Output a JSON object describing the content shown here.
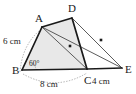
{
  "figure": {
    "kind": "geometry-diagram",
    "canvas": {
      "width": 136,
      "height": 94
    },
    "colors": {
      "background": "#ffffff",
      "shade_fill": "#e8e8e8",
      "stroke_heavy": "#1a1a1a",
      "stroke_light": "#555555",
      "dotted_arc": "#9a9a9a",
      "label_text": "#1a1a1a"
    },
    "vertices": [
      {
        "id": "A",
        "label": "A",
        "x": 42,
        "y": 27,
        "label_x": 35,
        "label_y": 22
      },
      {
        "id": "B",
        "label": "B",
        "x": 22,
        "y": 70,
        "label_x": 12,
        "label_y": 74
      },
      {
        "id": "C",
        "label": "C",
        "x": 87,
        "y": 69,
        "label_x": 84,
        "label_y": 84
      },
      {
        "id": "D",
        "label": "D",
        "x": 72,
        "y": 18,
        "label_x": 68,
        "label_y": 12
      },
      {
        "id": "E",
        "label": "E",
        "x": 122,
        "y": 68,
        "label_x": 125,
        "label_y": 73
      }
    ],
    "shaded_region": {
      "name": "quadrilateral-ABCD",
      "points": "42,27 72,18 87,69 22,70"
    },
    "segments": [
      {
        "id": "BA",
        "from": "B",
        "to": "A",
        "weight": "heavy"
      },
      {
        "id": "AD",
        "from": "A",
        "to": "D",
        "weight": "heavy"
      },
      {
        "id": "DC",
        "from": "D",
        "to": "C",
        "weight": "heavy"
      },
      {
        "id": "BC",
        "from": "B",
        "to": "C",
        "weight": "heavy"
      },
      {
        "id": "CE",
        "from": "C",
        "to": "E",
        "weight": "heavy"
      },
      {
        "id": "AC",
        "from": "A",
        "to": "C",
        "weight": "light"
      },
      {
        "id": "AE",
        "from": "A",
        "to": "E",
        "weight": "light"
      },
      {
        "id": "DE",
        "from": "D",
        "to": "E",
        "weight": "light"
      }
    ],
    "measure_labels": [
      {
        "id": "AB-length",
        "text": "6 cm",
        "x": 3,
        "y": 44,
        "on_segment": "AB"
      },
      {
        "id": "BC-length",
        "text": "8 cm",
        "x": 40,
        "y": 87,
        "on_segment": "BC"
      },
      {
        "id": "CE-length",
        "text": "4 cm",
        "x": 92,
        "y": 84,
        "on_segment": "CE"
      }
    ],
    "angles": [
      {
        "id": "angle-B",
        "text": "60°",
        "at": "B",
        "x": 29,
        "y": 66
      }
    ],
    "tick_marks": [
      {
        "id": "tick-AE",
        "on_segment": "AE",
        "x": 70,
        "y": 46
      },
      {
        "id": "tick-DE",
        "on_segment": "DE",
        "x": 101,
        "y": 40
      }
    ],
    "dotted_arcs": [
      {
        "id": "arc-A-to-B",
        "path": "M 39 31 Q 22 46 20 72"
      },
      {
        "id": "arc-B-to-C",
        "path": "M 23 74 Q 55 92 87 73"
      },
      {
        "id": "arc-angle-B",
        "path": "M 36 70 A 14 14 0 0 0 30 60"
      }
    ]
  }
}
